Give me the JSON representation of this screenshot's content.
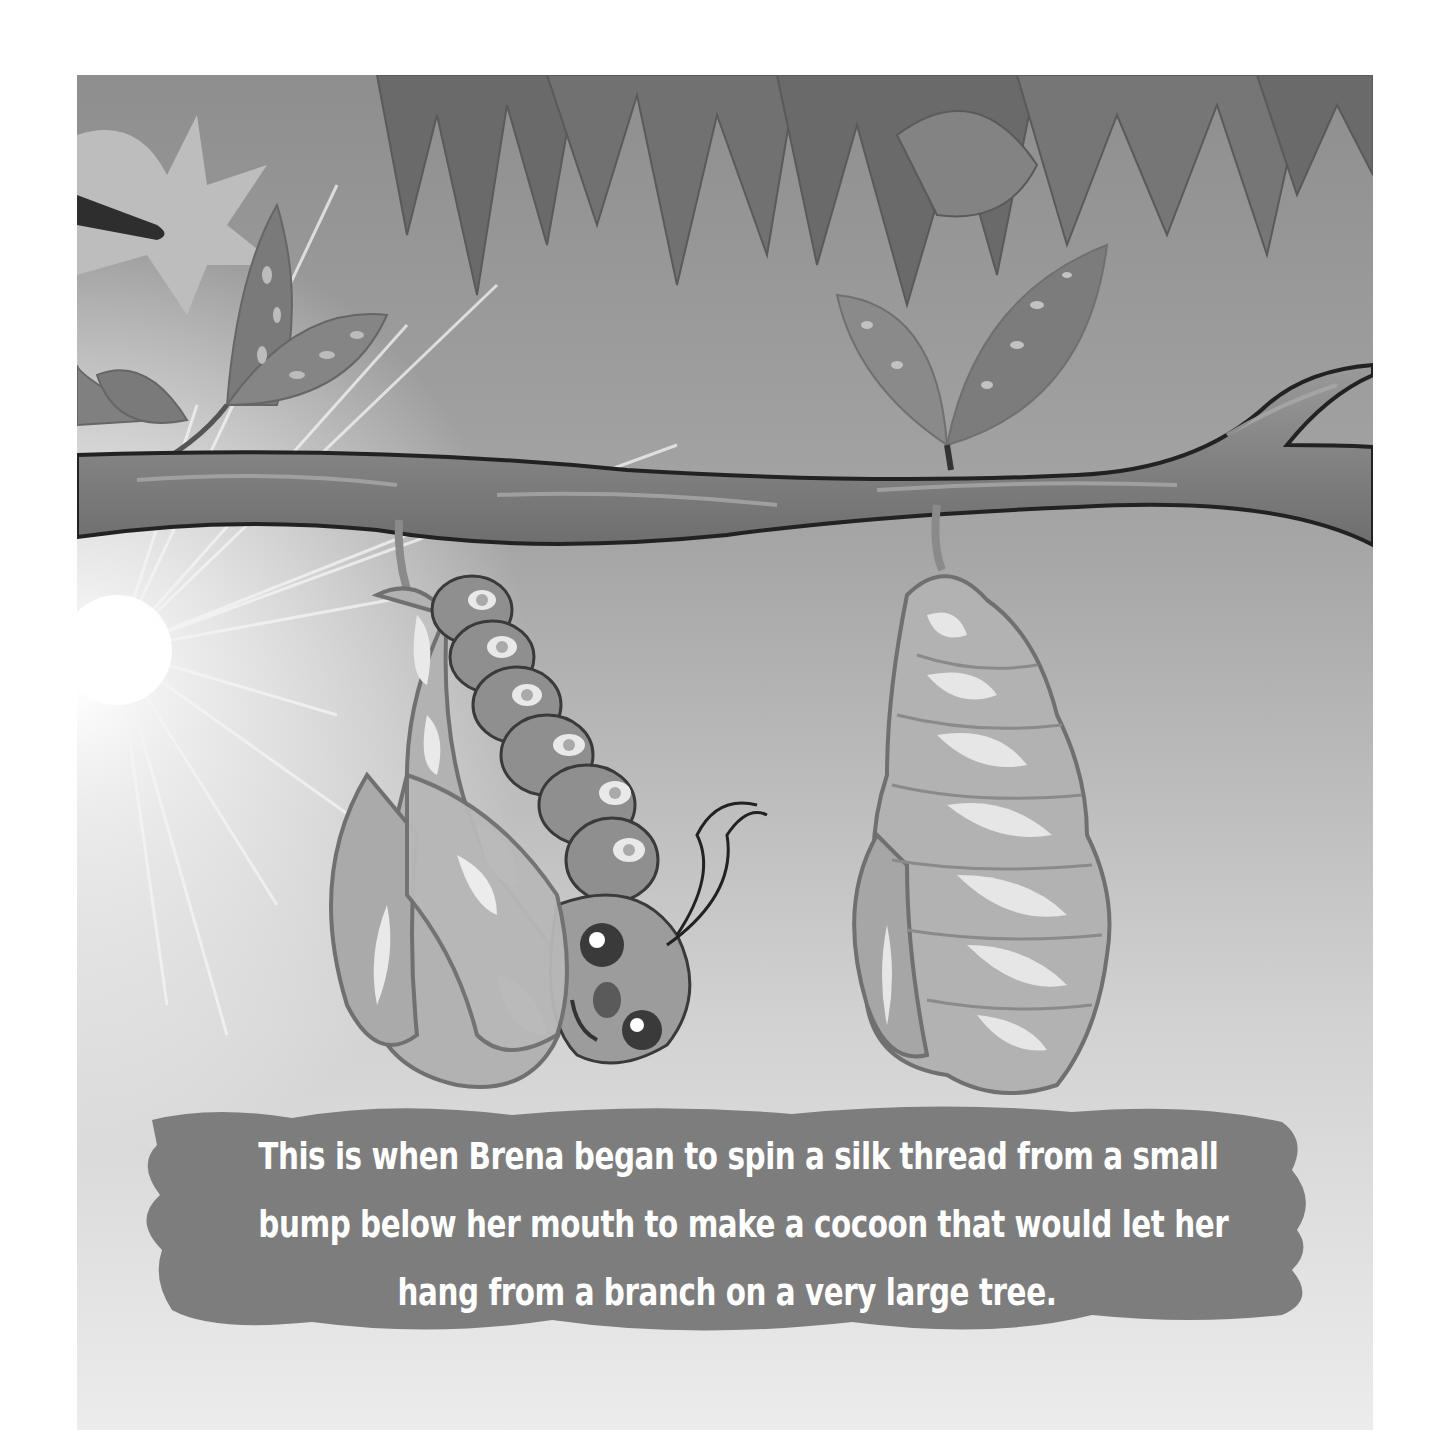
{
  "illustration": {
    "description": "Storybook page: a smiling caterpillar named Brena partially wrapped in a cocoon hangs from a tree branch next to a second closed cocoon, with leaves above and a sunburst at left.",
    "elements": [
      "tree-leaves",
      "sunburst",
      "tree-branch",
      "caterpillar-in-cocoon",
      "closed-cocoon"
    ],
    "colors": {
      "background": "#e6e6e6",
      "sky_top": "#9a9a9a",
      "leaf_dark": "#6f6f6f",
      "branch": "#8a8a8a",
      "cocoon": "#b4b4b4",
      "caption_bg": "#7d7d7d",
      "caption_text": "#ffffff"
    }
  },
  "caption": {
    "lines": [
      "This is when Brena began to spin a silk thread from a small",
      "bump below her mouth to make a cocoon that would let her",
      "hang from a branch on a very large tree."
    ]
  }
}
